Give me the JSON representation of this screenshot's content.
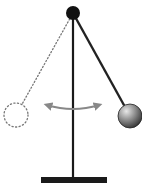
{
  "diagram": {
    "type": "pendulum",
    "colors": {
      "background": "#ffffff",
      "stand": "#1a1a1a",
      "pivot": "#111111",
      "rod": "#222222",
      "bob_light": "#e8e8e8",
      "bob_dark": "#333333",
      "ghost": "#777777",
      "arrow": "#888888"
    },
    "pivot": {
      "cx": 73,
      "cy": 13,
      "r": 7
    },
    "stand": {
      "x": 73,
      "y1": 13,
      "y2": 180
    },
    "base": {
      "x": 41,
      "y": 177,
      "width": 66,
      "height": 6
    },
    "bob": {
      "cx": 130,
      "cy": 116,
      "r": 12
    },
    "ghost_bob": {
      "cx": 16,
      "cy": 115,
      "r": 12
    },
    "swing_arrow": {
      "x1": 47,
      "x2": 99,
      "y": 105,
      "sag": 4
    }
  }
}
